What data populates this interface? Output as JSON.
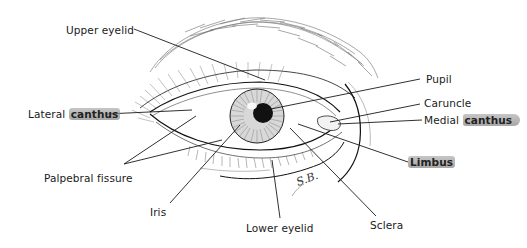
{
  "diagram": {
    "signature": "S.B.",
    "highlight_color": "#9a9a9a",
    "line_color": "#1a1a1a",
    "labels": {
      "upper_eyelid": "Upper eyelid",
      "lateral_canthus_prefix": "Lateral",
      "lateral_canthus_highlight": "canthus",
      "palpebral_fissure": "Palpebral fissure",
      "iris": "Iris",
      "lower_eyelid": "Lower eyelid",
      "sclera": "Sclera",
      "limbus": "Limbus",
      "medial_canthus_prefix": "Medial",
      "medial_canthus_highlight": "canthus",
      "caruncle": "Caruncle",
      "pupil": "Pupil"
    }
  }
}
